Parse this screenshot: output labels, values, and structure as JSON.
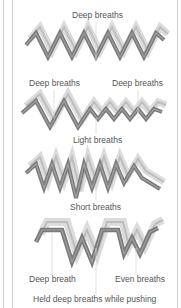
{
  "diagram": {
    "colors": {
      "wave_stroke": "#7a7a7a",
      "wave_highlight": "#a9a9a9",
      "wave_shadow": "#d6d6d6",
      "frame": "#cfcfcf",
      "text": "#555555"
    },
    "panels": [
      {
        "id": "deep",
        "labels": [
          "Deep breaths"
        ]
      },
      {
        "id": "mixed",
        "labels": [
          "Deep breaths",
          "Deep breaths",
          "Light breaths"
        ]
      },
      {
        "id": "short",
        "labels": [
          "Short breaths"
        ]
      },
      {
        "id": "held",
        "labels": [
          "Deep breath",
          "Even breaths",
          "Held deep breaths while pushing"
        ]
      }
    ]
  }
}
